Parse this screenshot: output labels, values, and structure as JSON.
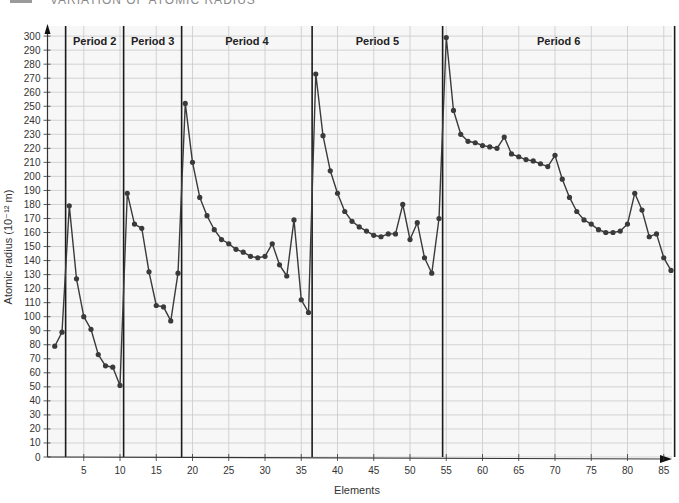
{
  "header": {
    "text": "VARIATION OF ATOMIC RADIUS"
  },
  "chart_data": {
    "type": "line",
    "title": "",
    "xlabel": "Elements",
    "ylabel": "Atomic radius (10⁻¹² m)",
    "ylim": [
      0,
      300
    ],
    "xlim": [
      0,
      87
    ],
    "grid": true,
    "legend": "none",
    "y_ticks": [
      0,
      10,
      20,
      30,
      40,
      50,
      60,
      70,
      80,
      90,
      100,
      110,
      120,
      130,
      140,
      150,
      160,
      170,
      180,
      190,
      200,
      210,
      220,
      230,
      240,
      250,
      260,
      270,
      280,
      290,
      300
    ],
    "x_ticks": [
      5,
      10,
      15,
      20,
      25,
      30,
      35,
      40,
      45,
      50,
      55,
      60,
      65,
      70,
      75,
      80,
      85
    ],
    "period_boundaries": [
      2.5,
      10.5,
      18.5,
      36.5,
      54.5,
      86.5
    ],
    "period_labels": [
      {
        "label": "Period 2",
        "x": 6.5
      },
      {
        "label": "Period 3",
        "x": 14.5
      },
      {
        "label": "Period 4",
        "x": 27.5
      },
      {
        "label": "Period 5",
        "x": 45.5
      },
      {
        "label": "Period 6",
        "x": 70.5
      }
    ],
    "series": [
      {
        "name": "Atomic radius",
        "color": "#3a3a3a",
        "x": [
          1,
          2,
          3,
          4,
          5,
          6,
          7,
          8,
          9,
          10,
          11,
          12,
          13,
          14,
          15,
          16,
          17,
          18,
          19,
          20,
          21,
          22,
          23,
          24,
          25,
          26,
          27,
          28,
          29,
          30,
          31,
          32,
          33,
          34,
          35,
          36,
          37,
          38,
          39,
          40,
          41,
          42,
          43,
          44,
          45,
          46,
          47,
          48,
          49,
          50,
          51,
          52,
          53,
          54,
          55,
          56,
          57,
          58,
          59,
          60,
          61,
          62,
          63,
          64,
          65,
          66,
          67,
          68,
          69,
          70,
          71,
          72,
          73,
          74,
          75,
          76,
          77,
          78,
          79,
          80,
          81,
          82,
          83,
          84,
          85,
          86
        ],
        "values": [
          79,
          89,
          179,
          127,
          100,
          91,
          73,
          65,
          64,
          51,
          188,
          166,
          163,
          132,
          108,
          107,
          97,
          131,
          252,
          210,
          185,
          172,
          162,
          155,
          152,
          148,
          146,
          143,
          142,
          143,
          152,
          137,
          129,
          169,
          112,
          103,
          273,
          229,
          204,
          188,
          175,
          168,
          164,
          161,
          158,
          157,
          159,
          159,
          180,
          155,
          167,
          142,
          131,
          170,
          299,
          247,
          230,
          225,
          224,
          222,
          221,
          220,
          228,
          216,
          214,
          212,
          211,
          209,
          207,
          215,
          198,
          185,
          175,
          169,
          166,
          162,
          160,
          160,
          161,
          166,
          188,
          176,
          157,
          159,
          142,
          133
        ]
      }
    ]
  },
  "colors": {
    "grid": "#c9c9c9",
    "axis": "#333333",
    "divider": "#1a1a1a",
    "line": "#3a3a3a",
    "marker": "#3a3a3a",
    "background": "#f7f7f7"
  }
}
